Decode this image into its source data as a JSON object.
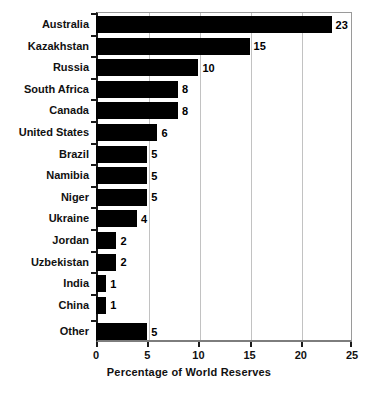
{
  "chart_data": {
    "type": "bar",
    "orientation": "horizontal",
    "title": "",
    "xlabel": "Percentage of World Reserves",
    "ylabel": "",
    "xlim": [
      0,
      25
    ],
    "xticks": [
      0,
      5,
      10,
      15,
      20,
      25
    ],
    "xtick_labels": [
      "0",
      "5",
      "10",
      "15",
      "20",
      "25"
    ],
    "grid": "vertical",
    "legend": "none",
    "bar_color": "#000000",
    "categories": [
      "Australia",
      "Kazakhstan",
      "Russia",
      "South Africa",
      "Canada",
      "United States",
      "Brazil",
      "Namibia",
      "Niger",
      "Ukraine",
      "Jordan",
      "Uzbekistan",
      "India",
      "China",
      "Other"
    ],
    "values": [
      23,
      15,
      10,
      8,
      8,
      6,
      5,
      5,
      5,
      4,
      2,
      2,
      1,
      1,
      5
    ],
    "value_labels": [
      "23",
      "15",
      "10",
      "8",
      "8",
      "6",
      "5",
      "5",
      "5",
      "4",
      "2",
      "2",
      "1",
      "1",
      "5"
    ]
  }
}
